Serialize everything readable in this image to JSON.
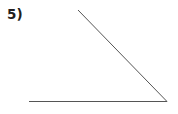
{
  "figure": {
    "label": "5)",
    "canvas": {
      "width": 178,
      "height": 114,
      "background": "#ffffff"
    },
    "line_color": "#555555",
    "line_width": 1,
    "elements": {
      "horizontal_ray": {
        "name": "horizontal-ray",
        "x1": 29,
        "y1": 101.5,
        "x2": 167,
        "y2": 101.5
      },
      "diagonal_ray": {
        "name": "diagonal-ray",
        "x1": 78,
        "y1": 10,
        "x2": 167,
        "y2": 101.5
      },
      "vertex": {
        "name": "angle-vertex",
        "x": 167,
        "y": 101.5
      }
    }
  },
  "chart_data": {
    "type": "diagram",
    "title": "5)",
    "subtitle": "",
    "xlabel": "",
    "ylabel": "",
    "annotations": [],
    "shapes": [
      {
        "kind": "line",
        "name": "horizontal-ray",
        "points": [
          [
            29,
            101.5
          ],
          [
            167,
            101.5
          ]
        ],
        "color": "#555555",
        "width": 1
      },
      {
        "kind": "line",
        "name": "diagonal-ray",
        "points": [
          [
            78,
            10
          ],
          [
            167,
            101.5
          ]
        ],
        "color": "#555555",
        "width": 1
      }
    ],
    "measurements": {
      "vertex": [
        167,
        101.5
      ],
      "ray_a_direction_deg": 180,
      "ray_b_direction_deg": 134,
      "interior_angle_deg": 46
    }
  }
}
